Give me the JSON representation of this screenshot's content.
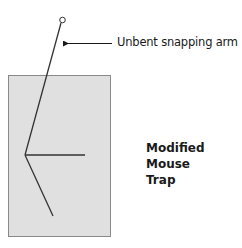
{
  "diagram": {
    "annotation": {
      "label": "Unbent snapping arm"
    },
    "title": {
      "lines": [
        "Modified",
        "Mouse",
        "Trap"
      ]
    },
    "colors": {
      "base_fill": "#e0e0e0",
      "base_stroke": "#8a8a8a",
      "line": "#333333",
      "text": "#1a1a1a"
    }
  }
}
